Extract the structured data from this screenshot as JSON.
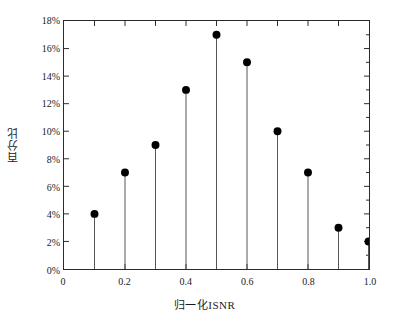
{
  "chart_data": {
    "type": "scatter",
    "style": "stem",
    "title": "",
    "xlabel": "归一化ISNR",
    "ylabel": "百分比",
    "x": [
      0.1,
      0.2,
      0.3,
      0.4,
      0.5,
      0.6,
      0.7,
      0.8,
      0.9,
      1.0
    ],
    "values": [
      4,
      7,
      9,
      13,
      17,
      15,
      10,
      7,
      3,
      2
    ],
    "value_unit": "%",
    "xlim": [
      0.0,
      1.0
    ],
    "ylim": [
      0,
      18
    ],
    "xticks": [
      0.0,
      0.1,
      0.2,
      0.3,
      0.4,
      0.5,
      0.6,
      0.7,
      0.8,
      0.9,
      1.0
    ],
    "xtick_labels_major": [
      "0",
      "0.2",
      "0.4",
      "0.6",
      "0.8",
      "1.0"
    ],
    "xticks_major": [
      0.0,
      0.2,
      0.4,
      0.6,
      0.8,
      1.0
    ],
    "yticks": [
      0,
      2,
      4,
      6,
      8,
      10,
      12,
      14,
      16,
      18
    ],
    "ytick_labels": [
      "0%",
      "2%",
      "4%",
      "6%",
      "8%",
      "10%",
      "12%",
      "14%",
      "16%",
      "18%"
    ],
    "grid": false,
    "legend": null,
    "marker_color": "#000000",
    "stem_color": "#555555",
    "axis_color": "#2b2b2b"
  },
  "axes": {
    "y_title": "百分比",
    "x_title": "归一化ISNR"
  }
}
